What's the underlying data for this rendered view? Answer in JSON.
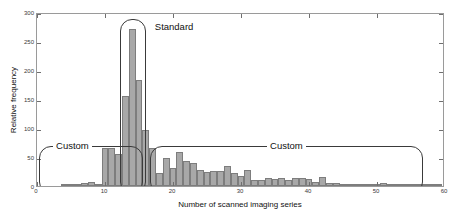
{
  "chart_data": {
    "type": "bar",
    "title": "",
    "subtitle": "",
    "xlabel": "Number of scanned imaging series",
    "ylabel": "Relative frequency",
    "xlim": [
      0,
      60
    ],
    "ylim": [
      0,
      300
    ],
    "grid": false,
    "legend": null,
    "bin_width": 1,
    "xticks": [
      0,
      10,
      20,
      30,
      40,
      50,
      60
    ],
    "xtick_labels": [
      "0",
      "10",
      "20",
      "30",
      "40",
      "50",
      "60"
    ],
    "yticks": [
      0,
      50,
      100,
      150,
      200,
      250,
      300
    ],
    "ytick_labels": [
      "0",
      "50",
      "100",
      "150",
      "200",
      "250",
      "300"
    ],
    "bar_color": "#a8a8a8",
    "bar_edge_color": "#7d7d7d",
    "x": [
      1,
      2,
      3,
      4,
      5,
      6,
      7,
      8,
      9,
      10,
      11,
      12,
      13,
      14,
      15,
      16,
      17,
      18,
      19,
      20,
      21,
      22,
      23,
      24,
      25,
      26,
      27,
      28,
      29,
      30,
      31,
      32,
      33,
      34,
      35,
      36,
      37,
      38,
      39,
      40,
      41,
      42,
      43,
      44,
      45,
      46,
      47,
      48,
      49,
      50,
      51,
      52,
      53,
      54,
      55,
      56,
      57,
      58,
      59
    ],
    "values": [
      0,
      0,
      0,
      2,
      2,
      3,
      6,
      7,
      3,
      65,
      66,
      56,
      155,
      270,
      183,
      97,
      66,
      22,
      49,
      31,
      59,
      43,
      40,
      27,
      25,
      26,
      26,
      35,
      22,
      17,
      27,
      10,
      11,
      13,
      12,
      14,
      10,
      14,
      13,
      12,
      7,
      15,
      6,
      5,
      4,
      4,
      3,
      4,
      3,
      2,
      5,
      2,
      2,
      1,
      1,
      1,
      1,
      1,
      1
    ],
    "annotations": [
      {
        "label": "Custom",
        "name": "annotation-custom-left",
        "x_range": [
          0.3,
          15.6
        ],
        "y_range": [
          0,
          72
        ],
        "label_anchor": "top-left"
      },
      {
        "label": "Standard",
        "name": "annotation-standard",
        "x_range": [
          12.2,
          16.0
        ],
        "y_range": [
          0,
          292
        ],
        "label_anchor": "top-right"
      },
      {
        "label": "Custom",
        "name": "annotation-custom-right",
        "x_range": [
          16.6,
          56.8
        ],
        "y_range": [
          0,
          72
        ],
        "label_anchor": "top-center"
      }
    ]
  }
}
